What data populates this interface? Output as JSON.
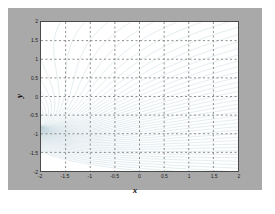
{
  "figure": {
    "background_color": "#a9a9a9",
    "page_background_color": "#ffffff",
    "axes_background_color": "#ffffff",
    "axes_border_color": "#4a4a4a"
  },
  "chart_data": {
    "type": "line",
    "render_style": "contour",
    "title": "",
    "xlabel": "x",
    "ylabel": "y",
    "xlim": [
      -2,
      2
    ],
    "ylim": [
      -2,
      2
    ],
    "xticks": [
      -2,
      -1.5,
      -1,
      -0.5,
      0,
      0.5,
      1,
      1.5,
      2
    ],
    "xticklabels": [
      "-2",
      "-1.5",
      "-1",
      "-0.5",
      "0",
      "0.5",
      "1",
      "1.5",
      "2"
    ],
    "yticks": [
      -2,
      -1.5,
      -1,
      -0.5,
      0,
      0.5,
      1,
      1.5,
      2
    ],
    "yticklabels": [
      "-2",
      "-1.5",
      "-1",
      "-0.5",
      "0",
      "0.5",
      "1",
      "1.5",
      "2"
    ],
    "grid": true,
    "grid_style": "dotted",
    "grid_color": "#8c8c8c",
    "legend": null,
    "contour_color": "#b9d0d6",
    "contour_line_width": 0.4,
    "n_levels": 60,
    "level_min": -6,
    "level_max": 6,
    "focus_point": [
      -2.0,
      -0.8
    ]
  }
}
